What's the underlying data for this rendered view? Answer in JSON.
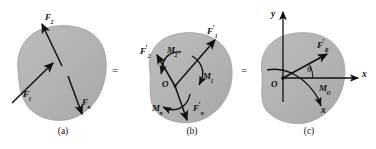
{
  "figure": {
    "type": "mechanics-force-reduction-diagram",
    "background_color": "#ffffff",
    "body_fill_color": "#b3b3b3",
    "body_edge_color": "#9a9a9a",
    "arrow_color": "#111111",
    "equals_sign": "=",
    "panels": [
      {
        "id": "a",
        "caption": "(a)",
        "labels": [
          {
            "name": "force-f2",
            "base": "F",
            "sub": "2",
            "prime": false
          },
          {
            "name": "force-f1",
            "base": "F",
            "sub": "1",
            "prime": false
          },
          {
            "name": "force-fn",
            "base": "F",
            "sub": "n",
            "prime": false
          }
        ]
      },
      {
        "id": "b",
        "caption": "(b)",
        "origin_label": "O",
        "labels": [
          {
            "name": "force-f1-prime",
            "base": "F",
            "sub": "1",
            "prime": true
          },
          {
            "name": "force-f2-prime",
            "base": "F",
            "sub": "2",
            "prime": true
          },
          {
            "name": "force-fn-prime",
            "base": "F",
            "sub": "n",
            "prime": true
          },
          {
            "name": "moment-m1",
            "base": "M",
            "sub": "1",
            "prime": false
          },
          {
            "name": "moment-m2",
            "base": "M",
            "sub": "2",
            "prime": false
          },
          {
            "name": "moment-mn",
            "base": "M",
            "sub": "n",
            "prime": false
          }
        ]
      },
      {
        "id": "c",
        "caption": "(c)",
        "origin_label": "O",
        "axis_x_label": "x",
        "axis_y_label": "y",
        "angle_label": "θ",
        "labels": [
          {
            "name": "resultant-force",
            "base": "F",
            "sub": "R",
            "prime": true
          },
          {
            "name": "resultant-moment",
            "base": "M",
            "sub": "O",
            "prime": false
          },
          {
            "name": "axis-x-tail",
            "base": "x",
            "sub": "",
            "prime": false
          }
        ]
      }
    ]
  },
  "panel_a": {
    "caption": "(a)",
    "f2_base": "F",
    "f2_sub": "2",
    "f1_base": "F",
    "f1_sub": "1",
    "fn_base": "F",
    "fn_sub": "n"
  },
  "panel_b": {
    "caption": "(b)",
    "origin": "O",
    "f1p_base": "F",
    "f1p_sub": "1",
    "f2p_base": "F",
    "f2p_sub": "2",
    "fnp_base": "F",
    "fnp_sub": "n",
    "m1_base": "M",
    "m1_sub": "1",
    "m2_base": "M",
    "m2_sub": "2",
    "mn_base": "M",
    "mn_sub": "n"
  },
  "panel_c": {
    "caption": "(c)",
    "origin": "O",
    "axis_x": "x",
    "axis_y": "y",
    "axis_x_lower": "x",
    "theta": "θ",
    "fr_base": "F",
    "fr_sub": "R",
    "mo_base": "M",
    "mo_sub": "O"
  },
  "separators": {
    "eq1": "=",
    "eq2": "="
  }
}
